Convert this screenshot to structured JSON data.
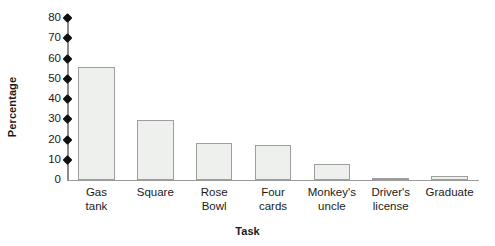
{
  "chart_data": {
    "type": "bar",
    "title": "",
    "subtitle": "",
    "xlabel": "Task",
    "ylabel": "Percentage",
    "categories": [
      "Gas\ntank",
      "Square",
      "Rose\nBowl",
      "Four\ncards",
      "Monkey's\nuncle",
      "Driver's\nlicense",
      "Graduate"
    ],
    "values": [
      56,
      29.5,
      18.5,
      17.5,
      8,
      1,
      2
    ],
    "ylim": [
      0,
      80
    ],
    "ytick_step": 10,
    "ytick_labels": [
      "80",
      "70",
      "60",
      "50",
      "40",
      "30",
      "20",
      "10",
      "0"
    ],
    "ytick_values": [
      80,
      70,
      60,
      50,
      40,
      30,
      20,
      10,
      0
    ],
    "grid": false,
    "legend": false,
    "legend_position": "none",
    "bar_fill_color": "#eef0ee",
    "bar_edge_color": "#9e9e9e",
    "axis_color": "#8c8c8c",
    "tick_marker_color": "#111111",
    "background_color": "#ffffff"
  }
}
